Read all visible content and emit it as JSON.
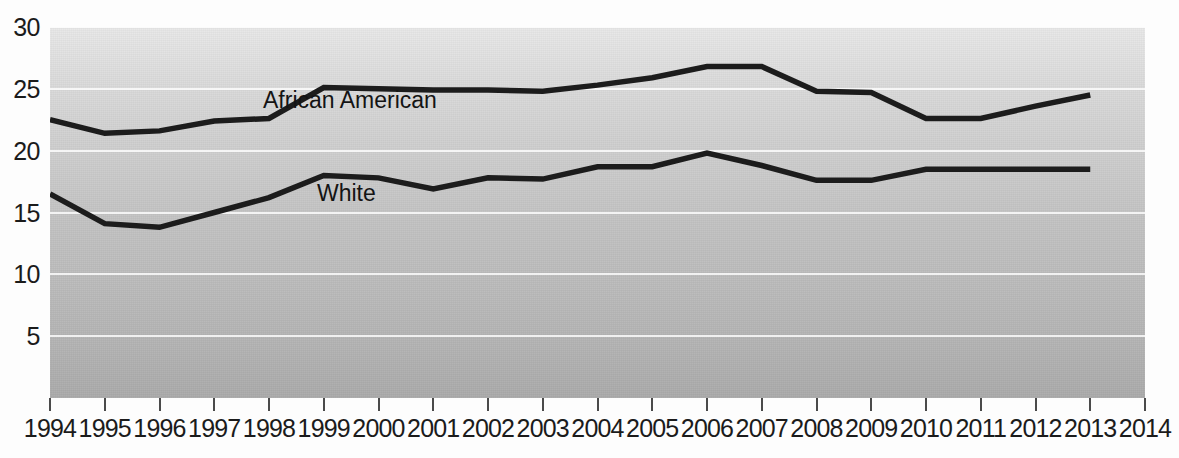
{
  "chart_data": {
    "type": "line",
    "title": "",
    "subtitle": "",
    "xlabel": "",
    "ylabel": "",
    "xlim": [
      1994,
      2014
    ],
    "ylim": [
      0,
      30
    ],
    "grid": true,
    "legend_position": "inline-annotation",
    "x_tick_labels": [
      "1994",
      "1995",
      "1996",
      "1997",
      "1998",
      "1999",
      "2000",
      "2001",
      "2002",
      "2003",
      "2004",
      "2005",
      "2006",
      "2007",
      "2008",
      "2009",
      "2010",
      "2011",
      "2012",
      "2013",
      "2014"
    ],
    "y_tick_labels": [
      "30",
      "25",
      "20",
      "15",
      "10",
      "5"
    ],
    "y_tick_values": [
      30,
      25,
      20,
      15,
      10,
      5
    ],
    "x": [
      1994,
      1995,
      1996,
      1997,
      1998,
      1999,
      2000,
      2001,
      2002,
      2003,
      2004,
      2005,
      2006,
      2007,
      2008,
      2009,
      2010,
      2011,
      2012,
      2013
    ],
    "series": [
      {
        "name": "African American",
        "label": "African American",
        "color": "#1c1c1c",
        "label_x": 213,
        "label_y": 60,
        "values": [
          22.5,
          21.4,
          21.6,
          22.4,
          22.6,
          25.1,
          25.0,
          24.9,
          24.9,
          24.8,
          25.3,
          25.9,
          26.8,
          26.8,
          24.8,
          24.7,
          22.6,
          22.6,
          23.6,
          24.5
        ]
      },
      {
        "name": "White",
        "label": "White",
        "color": "#1c1c1c",
        "label_x": 267,
        "label_y": 153,
        "values": [
          16.5,
          14.1,
          13.8,
          15.0,
          16.2,
          18.0,
          17.8,
          16.9,
          17.8,
          17.7,
          18.7,
          18.7,
          19.8,
          18.8,
          17.6,
          17.6,
          18.5,
          18.5,
          18.5,
          18.5
        ]
      }
    ]
  }
}
